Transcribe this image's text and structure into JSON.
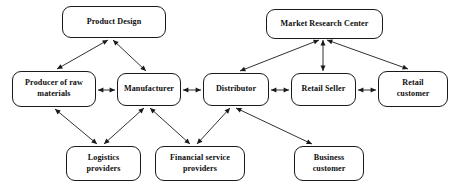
{
  "diagram": {
    "background_color": "#ffffff",
    "node_border_color": "#1a1a1a",
    "edge_color": "#1a1a1a",
    "nodes": [
      {
        "id": "product-design",
        "label": "Product Design",
        "x": 62,
        "y": 6,
        "w": 104,
        "h": 32
      },
      {
        "id": "market-research",
        "label": "Market Research Center",
        "x": 266,
        "y": 9,
        "w": 117,
        "h": 30
      },
      {
        "id": "producer-raw",
        "label": "Producer of raw\nmaterials",
        "x": 12,
        "y": 71,
        "w": 84,
        "h": 36
      },
      {
        "id": "manufacturer",
        "label": "Manufacturer",
        "x": 117,
        "y": 73,
        "w": 64,
        "h": 33
      },
      {
        "id": "distributor",
        "label": "Distributor",
        "x": 203,
        "y": 73,
        "w": 66,
        "h": 33
      },
      {
        "id": "retail-seller",
        "label": "Retail Seller",
        "x": 291,
        "y": 73,
        "w": 65,
        "h": 33
      },
      {
        "id": "retail-customer",
        "label": "Retail\ncustomer",
        "x": 378,
        "y": 71,
        "w": 70,
        "h": 36
      },
      {
        "id": "logistics-providers",
        "label": "Logistics\nproviders",
        "x": 66,
        "y": 146,
        "w": 75,
        "h": 35
      },
      {
        "id": "financial-providers",
        "label": "Financial service\nproviders",
        "x": 155,
        "y": 146,
        "w": 90,
        "h": 35
      },
      {
        "id": "business-customer",
        "label": "Business\ncustomer",
        "x": 294,
        "y": 146,
        "w": 70,
        "h": 35
      }
    ],
    "edges": [
      {
        "id": "product-design-to-producer",
        "from": "product-design",
        "to": "producer-raw",
        "x1": 108,
        "y1": 40,
        "x2": 57,
        "y2": 69,
        "arrows": "both"
      },
      {
        "id": "product-design-to-manufacturer",
        "from": "product-design",
        "to": "manufacturer",
        "x1": 113,
        "y1": 40,
        "x2": 146,
        "y2": 71,
        "arrows": "both"
      },
      {
        "id": "market-research-to-distributor",
        "from": "market-research",
        "to": "distributor",
        "x1": 319,
        "y1": 40,
        "x2": 240,
        "y2": 71,
        "arrows": "both"
      },
      {
        "id": "market-research-to-retail-seller",
        "from": "market-research",
        "to": "retail-seller",
        "x1": 323,
        "y1": 40,
        "x2": 323,
        "y2": 71,
        "arrows": "both"
      },
      {
        "id": "market-research-to-retail-customer",
        "from": "market-research",
        "to": "retail-customer",
        "x1": 327,
        "y1": 40,
        "x2": 408,
        "y2": 69,
        "arrows": "both"
      },
      {
        "id": "producer-to-manufacturer",
        "from": "producer-raw",
        "to": "manufacturer",
        "x1": 98,
        "y1": 90,
        "x2": 115,
        "y2": 90,
        "arrows": "both"
      },
      {
        "id": "manufacturer-to-distributor",
        "from": "manufacturer",
        "to": "distributor",
        "x1": 183,
        "y1": 90,
        "x2": 201,
        "y2": 90,
        "arrows": "both"
      },
      {
        "id": "distributor-to-retail-seller",
        "from": "distributor",
        "to": "retail-seller",
        "x1": 271,
        "y1": 90,
        "x2": 289,
        "y2": 90,
        "arrows": "both"
      },
      {
        "id": "retail-seller-to-retail-customer",
        "from": "retail-seller",
        "to": "retail-customer",
        "x1": 358,
        "y1": 90,
        "x2": 376,
        "y2": 90,
        "arrows": "both"
      },
      {
        "id": "producer-to-logistics",
        "from": "producer-raw",
        "to": "logistics-providers",
        "x1": 55,
        "y1": 109,
        "x2": 97,
        "y2": 144,
        "arrows": "both"
      },
      {
        "id": "manufacturer-to-logistics",
        "from": "manufacturer",
        "to": "logistics-providers",
        "x1": 144,
        "y1": 108,
        "x2": 104,
        "y2": 144,
        "arrows": "both"
      },
      {
        "id": "manufacturer-to-financial",
        "from": "manufacturer",
        "to": "financial-providers",
        "x1": 150,
        "y1": 108,
        "x2": 190,
        "y2": 144,
        "arrows": "both"
      },
      {
        "id": "distributor-to-financial",
        "from": "distributor",
        "to": "financial-providers",
        "x1": 230,
        "y1": 108,
        "x2": 197,
        "y2": 144,
        "arrows": "both"
      },
      {
        "id": "distributor-to-business-customer",
        "from": "distributor",
        "to": "business-customer",
        "x1": 236,
        "y1": 108,
        "x2": 312,
        "y2": 144,
        "arrows": "both"
      }
    ]
  }
}
